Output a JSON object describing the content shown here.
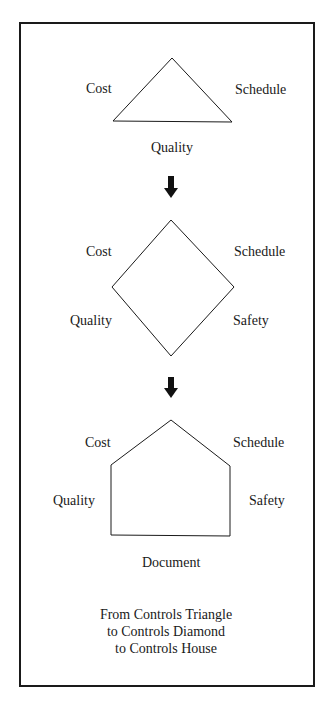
{
  "diagram": {
    "triangle": {
      "name": "Controls Triangle",
      "labels": {
        "left": "Cost",
        "right": "Schedule",
        "bottom": "Quality"
      }
    },
    "diamond": {
      "name": "Controls Diamond",
      "labels": {
        "top_left": "Cost",
        "top_right": "Schedule",
        "bottom_left": "Quality",
        "bottom_right": "Safety"
      }
    },
    "house": {
      "name": "Controls House",
      "labels": {
        "top_left": "Cost",
        "top_right": "Schedule",
        "left": "Quality",
        "right": "Safety",
        "bottom": "Document"
      }
    },
    "arrows": [
      "down-arrow",
      "down-arrow"
    ],
    "caption": {
      "line1": "From Controls Triangle",
      "line2": "to Controls Diamond",
      "line3": "to Controls House"
    },
    "colors": {
      "stroke": "#1a1a1a",
      "background": "#ffffff"
    }
  }
}
